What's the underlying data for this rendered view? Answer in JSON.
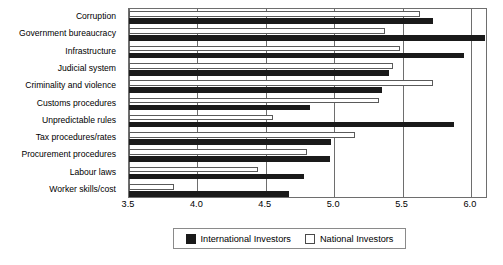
{
  "chart_data": {
    "type": "bar",
    "orientation": "horizontal",
    "title": "",
    "subtitle": "",
    "xlabel": "",
    "ylabel": "",
    "xlim": [
      3.5,
      6.125
    ],
    "xticks": [
      "3.5",
      "4.0",
      "4.5",
      "5.0",
      "5.5",
      "6.0"
    ],
    "xtick_values": [
      3.5,
      4.0,
      4.5,
      5.0,
      5.5,
      6.0
    ],
    "grid": true,
    "grid_axis": "x",
    "legend_position": "bottom",
    "categories": [
      "Corruption",
      "Government bureaucracy",
      "Infrastructure",
      "Judicial system",
      "Criminality and violence",
      "Customs procedures",
      "Unpredictable rules",
      "Tax procedures/rates",
      "Procurement procedures",
      "Labour laws",
      "Worker skills/cost"
    ],
    "series": [
      {
        "name": "International Investors",
        "color": "#1a1a1a",
        "values": [
          5.72,
          6.1,
          5.95,
          5.4,
          5.35,
          4.82,
          5.88,
          4.98,
          4.97,
          4.78,
          4.67
        ]
      },
      {
        "name": "National Investors",
        "color": "#ffffff",
        "values": [
          5.63,
          5.37,
          5.48,
          5.43,
          5.72,
          5.33,
          4.55,
          5.15,
          4.8,
          4.44,
          3.83
        ]
      }
    ]
  },
  "legend": {
    "items": [
      {
        "label": "International Investors",
        "swatch": "filled-black-square"
      },
      {
        "label": "National Investors",
        "swatch": "outlined-white-square"
      }
    ]
  }
}
